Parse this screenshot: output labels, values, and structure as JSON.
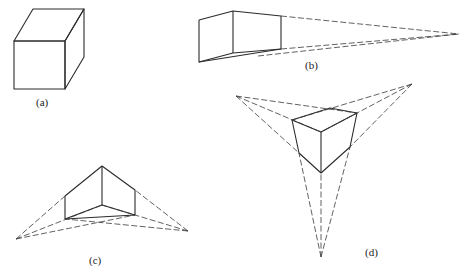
{
  "figure": {
    "panels": [
      {
        "id": "a",
        "label": "(a)",
        "description": "Parallel projection of a cube"
      },
      {
        "id": "b",
        "label": "(b)",
        "description": "One-point perspective"
      },
      {
        "id": "c",
        "label": "(c)",
        "description": "Two-point perspective"
      },
      {
        "id": "d",
        "label": "(d)",
        "description": "Three-point perspective"
      }
    ]
  },
  "colors": {
    "line": "#2b2b2b",
    "background": "#ffffff"
  }
}
